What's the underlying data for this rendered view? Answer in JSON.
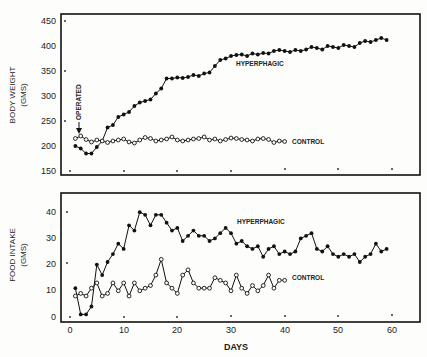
{
  "chart_data": [
    {
      "type": "line",
      "title": "",
      "xlabel": "",
      "ylabel": "BODY WEIGHT (GMS)",
      "ylabel_lines": [
        "BODY WEIGHT",
        "(GMS)"
      ],
      "ylim": [
        150,
        450
      ],
      "yticks": [
        150,
        200,
        250,
        300,
        350,
        400,
        450
      ],
      "xlim": [
        0,
        60
      ],
      "grid": false,
      "annotation": "OPERATED",
      "annotation_x": 2,
      "series": [
        {
          "name": "HYPERPHAGIC",
          "marker": "filled-circle",
          "x": [
            1,
            2,
            3,
            4,
            5,
            6,
            7,
            8,
            9,
            10,
            11,
            12,
            13,
            14,
            15,
            16,
            17,
            18,
            19,
            20,
            21,
            22,
            23,
            24,
            25,
            26,
            27,
            28,
            29,
            30,
            31,
            32,
            33,
            34,
            35,
            36,
            37,
            38,
            39,
            40,
            41,
            42,
            43,
            44,
            45,
            46,
            47,
            48,
            49,
            50,
            51,
            52,
            53,
            54,
            55,
            56,
            57,
            58,
            59
          ],
          "values": [
            200,
            195,
            185,
            185,
            198,
            210,
            237,
            242,
            258,
            263,
            268,
            280,
            287,
            290,
            293,
            305,
            315,
            335,
            335,
            337,
            336,
            338,
            342,
            340,
            345,
            347,
            360,
            372,
            375,
            380,
            382,
            383,
            380,
            385,
            383,
            386,
            385,
            390,
            392,
            390,
            388,
            392,
            390,
            393,
            398,
            396,
            393,
            400,
            398,
            396,
            402,
            400,
            398,
            406,
            410,
            408,
            412,
            416,
            412
          ]
        },
        {
          "name": "CONTROL",
          "marker": "open-circle",
          "x": [
            1,
            2,
            3,
            4,
            5,
            6,
            7,
            8,
            9,
            10,
            11,
            12,
            13,
            14,
            15,
            16,
            17,
            18,
            19,
            20,
            21,
            22,
            23,
            24,
            25,
            26,
            27,
            28,
            29,
            30,
            31,
            32,
            33,
            34,
            35,
            36,
            37,
            38,
            39,
            40
          ],
          "values": [
            215,
            220,
            213,
            208,
            212,
            210,
            207,
            210,
            212,
            214,
            208,
            206,
            212,
            217,
            215,
            210,
            212,
            214,
            218,
            212,
            210,
            212,
            214,
            215,
            218,
            212,
            214,
            210,
            213,
            216,
            215,
            213,
            212,
            210,
            214,
            215,
            213,
            207,
            210,
            209
          ]
        }
      ],
      "series_labels": [
        "HYPERPHAGIC",
        "CONTROL"
      ]
    },
    {
      "type": "line",
      "title": "",
      "xlabel": "DAYS",
      "ylabel": "FOOD INTAKE (GMS)",
      "ylabel_lines": [
        "FOOD INTAKE",
        "(GMS)"
      ],
      "ylim": [
        0,
        45
      ],
      "yticks": [
        0,
        10,
        20,
        30,
        40
      ],
      "xlim": [
        0,
        60
      ],
      "xticks": [
        0,
        10,
        20,
        30,
        40,
        50,
        60
      ],
      "grid": false,
      "series": [
        {
          "name": "HYPERPHAGIC",
          "marker": "filled-circle",
          "x": [
            1,
            2,
            3,
            4,
            5,
            6,
            7,
            8,
            9,
            10,
            11,
            12,
            13,
            14,
            15,
            16,
            17,
            18,
            19,
            20,
            21,
            22,
            23,
            24,
            25,
            26,
            27,
            28,
            29,
            30,
            31,
            32,
            33,
            34,
            35,
            36,
            37,
            38,
            39,
            40,
            41,
            42,
            43,
            44,
            45,
            46,
            47,
            48,
            49,
            50,
            51,
            52,
            53,
            54,
            55,
            56,
            57,
            58,
            59
          ],
          "values": [
            11,
            1,
            1,
            4,
            20,
            16,
            21,
            24,
            28,
            26,
            35,
            33,
            40,
            39,
            35,
            39,
            39,
            36,
            33,
            34,
            29,
            31,
            33,
            31,
            31,
            29,
            30,
            32,
            34,
            32,
            28,
            29,
            27,
            26,
            27,
            23,
            26,
            27,
            24,
            25,
            24,
            25,
            30,
            31,
            32,
            26,
            25,
            27,
            24,
            23,
            24,
            23,
            24,
            21,
            23,
            24,
            28,
            25,
            26
          ],
          "label": "HYPERPHAGIC"
        },
        {
          "name": "CONTROL",
          "marker": "open-circle",
          "x": [
            1,
            2,
            3,
            4,
            5,
            6,
            7,
            8,
            9,
            10,
            11,
            12,
            13,
            14,
            15,
            16,
            17,
            18,
            19,
            20,
            21,
            22,
            23,
            24,
            25,
            26,
            27,
            28,
            29,
            30,
            31,
            32,
            33,
            34,
            35,
            36,
            37,
            38,
            39,
            40
          ],
          "values": [
            8,
            9,
            8,
            11,
            13,
            8,
            9,
            13,
            10,
            13,
            8,
            13,
            10,
            11,
            12,
            16,
            22,
            13,
            11,
            9,
            16,
            18,
            13,
            11,
            11,
            11,
            15,
            14,
            13,
            10,
            16,
            11,
            9,
            12,
            10,
            12,
            16,
            11,
            14,
            14
          ],
          "label": "CONTROL"
        }
      ]
    }
  ],
  "top": {
    "ylabel_line1": "BODY WEIGHT",
    "ylabel_line2": "(GMS)",
    "yticks": [
      "450",
      "400",
      "350",
      "300",
      "250",
      "200",
      "150"
    ],
    "annotation": "OPERATED",
    "hyperphagic_label": "HYPERPHAGIC",
    "control_label": "CONTROL"
  },
  "bottom": {
    "ylabel_line1": "FOOD INTAKE",
    "ylabel_line2": "(GMS)",
    "yticks": [
      "40",
      "30",
      "20",
      "10",
      "0"
    ],
    "xticks": [
      "0",
      "10",
      "20",
      "30",
      "40",
      "50",
      "60"
    ],
    "xlabel": "DAYS",
    "hyperphagic_label": "HYPERPHAGIC",
    "control_label": "CONTROL"
  }
}
